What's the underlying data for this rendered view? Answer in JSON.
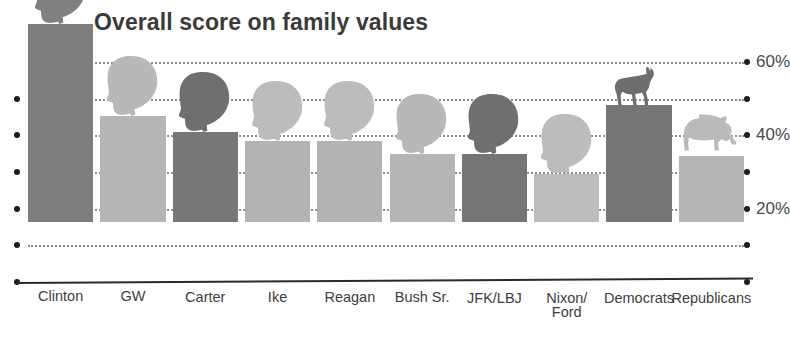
{
  "chart_data": {
    "type": "bar",
    "title": "Overall score on family values",
    "xlabel": "",
    "ylabel": "",
    "ylim": [
      0,
      60
    ],
    "grid": true,
    "legend_position": "none",
    "ytick_values": [
      0,
      10,
      20,
      30,
      40,
      50,
      60
    ],
    "ytick_labels": [
      "",
      "",
      "20%",
      "",
      "40%",
      "",
      "60%"
    ],
    "categories": [
      "Clinton",
      "GW",
      "Carter",
      "Ike",
      "Reagan",
      "Bush Sr.",
      "JFK/LBJ",
      "Nixon/\nFord",
      "Democrats",
      "Republicans"
    ],
    "values": [
      54,
      29,
      24.5,
      22,
      22,
      18.5,
      18.5,
      13,
      32,
      18
    ],
    "bar_colors": [
      "#7d7d7d",
      "#b5b5b5",
      "#777777",
      "#b3b3b3",
      "#b3b3b3",
      "#b5b5b5",
      "#757575",
      "#bdbdbd",
      "#757575",
      "#b5b5b5"
    ],
    "icon_colors": [
      "#808080",
      "#b8b8b8",
      "#6f6f6f",
      "#bcbcbc",
      "#bcbcbc",
      "#b8b8b8",
      "#6f6f6f",
      "#bcbcbc",
      "#6d6d6d",
      "#bababa"
    ],
    "icons": [
      "head-silhouette",
      "head-silhouette",
      "head-silhouette",
      "head-silhouette",
      "head-silhouette",
      "head-silhouette",
      "head-silhouette",
      "head-silhouette",
      "donkey-silhouette",
      "elephant-silhouette"
    ]
  },
  "axis": {
    "label_60": "60%",
    "label_40": "40%",
    "label_20": "20%"
  }
}
